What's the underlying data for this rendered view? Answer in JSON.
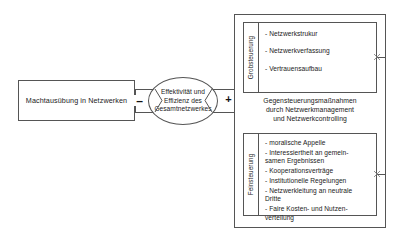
{
  "diagram": {
    "title_absent": true,
    "source_box": {
      "label": "Machtausübung in\nNetzwerken"
    },
    "center_node": {
      "label": "Effektivität und\nEffizienz des\nGesamtnetzwerkes"
    },
    "connectors": {
      "negative_sign": "–",
      "positive_sign": "+"
    },
    "panel": {
      "caption": "Gegensteuerungsmaßnahmen\ndurch Netzwerkmanagement\nund Netzwerkcontrolling",
      "groups": [
        {
          "vertical_label": "Grobsteuerung",
          "items": [
            "- Netzwerkstrukur",
            "- Netzwerkverfassung",
            "- Vertrauensaufbau"
          ]
        },
        {
          "vertical_label": "Feinsteuerung",
          "items": [
            "- moralische Appelle",
            "- Interessiertheit an gemein-\n   samen Ergebnissen",
            "- Kooperationsverträge",
            "- Institutionelle Regelungen",
            "- Netzwerkleitung an neutrale\n   Dritte",
            "- Faire Kosten- und Nutzen-\n   verteilung"
          ]
        }
      ]
    },
    "colors": {
      "stroke": "#555555",
      "text": "#1a1a1a",
      "background": "#ffffff"
    }
  }
}
